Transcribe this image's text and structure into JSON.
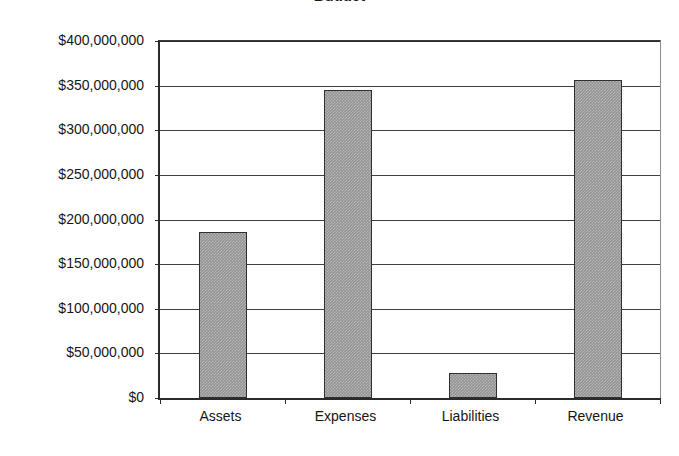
{
  "chart_data": {
    "type": "bar",
    "title": "Budget",
    "subtitle": "",
    "xlabel": "",
    "ylabel": "",
    "categories": [
      "Assets",
      "Expenses",
      "Liabilities",
      "Revenue"
    ],
    "values": [
      186000000,
      345000000,
      28000000,
      356000000
    ],
    "series": [
      {
        "name": "Amount",
        "values": [
          186000000,
          345000000,
          28000000,
          356000000
        ]
      }
    ],
    "ylim": [
      0,
      400000000
    ],
    "ytick_values": [
      0,
      50000000,
      100000000,
      150000000,
      200000000,
      250000000,
      300000000,
      350000000,
      400000000
    ],
    "ytick_labels": [
      "$0",
      "$50,000,000",
      "$100,000,000",
      "$150,000,000",
      "$200,000,000",
      "$250,000,000",
      "$300,000,000",
      "$350,000,000",
      "$400,000,000"
    ],
    "grid": true,
    "grid_axis": "y",
    "legend": false,
    "legend_position": "none",
    "bar_color": "#949494",
    "bar_edge_color": "#2f2f2f",
    "axis_color": "#2b2b2b",
    "background_color": "#ffffff",
    "text_color": "#161616"
  }
}
